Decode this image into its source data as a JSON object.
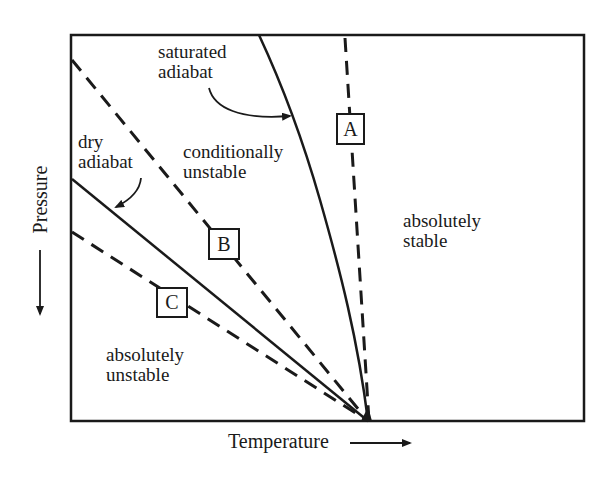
{
  "diagram": {
    "x_axis_label": "Temperature",
    "y_axis_label": "Pressure",
    "x_axis_direction": "increasing-right-arrow",
    "y_axis_direction": "increasing-down-arrow",
    "curves": {
      "saturated_adiabat": {
        "label_line1": "saturated",
        "label_line2": "adiabat",
        "style": "solid"
      },
      "dry_adiabat": {
        "label_line1": "dry",
        "label_line2": "adiabat",
        "style": "solid"
      },
      "profile_a": {
        "label": "A",
        "style": "dashed"
      },
      "profile_b": {
        "label": "B",
        "style": "dashed"
      },
      "profile_c": {
        "label": "C",
        "style": "dashed"
      }
    },
    "regions": {
      "conditionally_unstable": {
        "line1": "conditionally",
        "line2": "unstable"
      },
      "absolutely_stable": {
        "line1": "absolutely",
        "line2": "stable"
      },
      "absolutely_unstable": {
        "line1": "absolutely",
        "line2": "unstable"
      }
    },
    "colors": {
      "ink": "#1a1a1a",
      "background": "#ffffff"
    }
  }
}
